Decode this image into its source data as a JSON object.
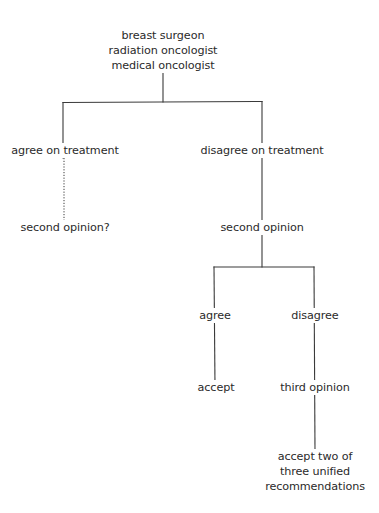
{
  "diagram": {
    "type": "decision-tree",
    "line_color": "#3a3a3a",
    "background": "#ffffff",
    "nodes": {
      "root": {
        "lines": [
          "breast surgeon",
          "radiation oncologist",
          "medical oncologist"
        ],
        "x": 163,
        "y": 28
      },
      "agree_on_treatment": {
        "lines": [
          "agree on treatment"
        ],
        "x": 65,
        "y": 143
      },
      "second_opinion_question": {
        "lines": [
          "second opinion?"
        ],
        "x": 65,
        "y": 220
      },
      "disagree_on_treatment": {
        "lines": [
          "disagree on treatment"
        ],
        "x": 262,
        "y": 143
      },
      "second_opinion": {
        "lines": [
          "second opinion"
        ],
        "x": 262,
        "y": 220
      },
      "agree": {
        "lines": [
          "agree"
        ],
        "x": 215,
        "y": 308
      },
      "disagree": {
        "lines": [
          "disagree"
        ],
        "x": 315,
        "y": 308
      },
      "accept": {
        "lines": [
          "accept"
        ],
        "x": 216,
        "y": 380
      },
      "third_opinion": {
        "lines": [
          "third opinion"
        ],
        "x": 315,
        "y": 380
      },
      "accept_two_of_three": {
        "lines": [
          "accept two of",
          "three unified",
          "recommendations"
        ],
        "x": 315,
        "y": 449
      }
    },
    "edges": [
      {
        "from": "root",
        "to": "agree_on_treatment",
        "style": "solid"
      },
      {
        "from": "root",
        "to": "disagree_on_treatment",
        "style": "solid"
      },
      {
        "from": "agree_on_treatment",
        "to": "second_opinion_question",
        "style": "dotted"
      },
      {
        "from": "disagree_on_treatment",
        "to": "second_opinion",
        "style": "solid"
      },
      {
        "from": "second_opinion",
        "to": "agree",
        "style": "solid"
      },
      {
        "from": "second_opinion",
        "to": "disagree",
        "style": "solid"
      },
      {
        "from": "agree",
        "to": "accept",
        "style": "solid"
      },
      {
        "from": "disagree",
        "to": "third_opinion",
        "style": "solid"
      },
      {
        "from": "third_opinion",
        "to": "accept_two_of_three",
        "style": "solid"
      }
    ]
  }
}
